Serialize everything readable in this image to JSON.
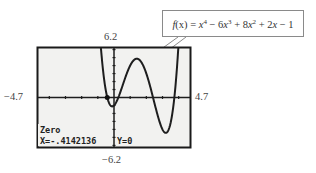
{
  "figure": {
    "callout": {
      "function_name": "f(x)",
      "expression_text": "f(x) = x^4 − 6x^3 + 8x^2 + 2x − 1",
      "parts": [
        "f",
        "(x) = ",
        "x",
        "4",
        " − 6",
        "x",
        "3",
        " + 8",
        "x",
        "2",
        " + 2",
        "x",
        " − 1"
      ]
    },
    "window": {
      "xmin": -4.7,
      "xmax": 4.7,
      "ymin": -6.2,
      "ymax": 6.2,
      "xmin_label": "−4.7",
      "xmax_label": "4.7",
      "ymin_label": "−6.2",
      "ymax_label": "6.2",
      "xscl": 1,
      "yscl": 1
    },
    "calculator_screen": {
      "mode_label": "Zero",
      "x_readout": "X=-.4142136",
      "y_readout": "Y=0",
      "cursor_point": {
        "x": -0.4142136,
        "y": 0
      }
    },
    "function": {
      "coefficients_desc": [
        1,
        -6,
        8,
        2,
        -1
      ]
    },
    "colors": {
      "screen_bg": "#f2f2f0",
      "screen_border": "#1a1a1a",
      "curve": "#1e1e1e",
      "axis": "#1e1e1e",
      "callout_border": "#8a8a8a"
    }
  }
}
